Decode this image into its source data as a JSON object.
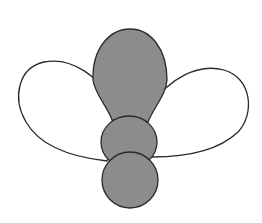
{
  "figure": {
    "colors": {
      "body_fill": "#8c8c8c",
      "wing_fill": "#ffffff",
      "stroke": "#2a2a2a",
      "background": "#ffffff"
    },
    "parts": [
      "left-wing",
      "right-wing",
      "abdomen",
      "thorax",
      "head"
    ]
  }
}
